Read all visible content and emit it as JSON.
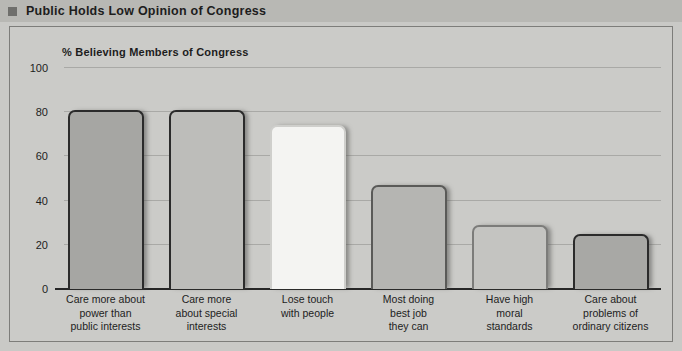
{
  "header": {
    "title": "Public Holds Low Opinion of Congress",
    "bullet_icon": "square-bullet-icon",
    "bar_color": "#b8b8b4",
    "bullet_color": "#6f6f6c"
  },
  "chart_data": {
    "type": "bar",
    "title": "Public Holds Low Opinion of Congress",
    "subtitle": "% Believing Members of Congress",
    "xlabel": "",
    "ylabel": "",
    "ylim": [
      0,
      100
    ],
    "yticks": [
      0,
      20,
      40,
      60,
      80,
      100
    ],
    "ytick_labels": [
      "0",
      "20",
      "40",
      "60",
      "80",
      "100"
    ],
    "grid": true,
    "legend": "none",
    "categories": [
      "Care more about power than public interests",
      "Care more about special interests",
      "Lose touch with people",
      "Most doing best job they can",
      "Have high moral standards",
      "Care about problems of ordinary citizens"
    ],
    "category_lines": [
      [
        "Care more about",
        "power than",
        "public interests"
      ],
      [
        "Care more",
        "about special",
        "interests"
      ],
      [
        "Lose touch",
        "with people"
      ],
      [
        "Most doing",
        "best job",
        "they can"
      ],
      [
        "Have high",
        "moral",
        "standards"
      ],
      [
        "Care about",
        "problems of",
        "ordinary citizens"
      ]
    ],
    "values": [
      81,
      81,
      74,
      47,
      29,
      25
    ],
    "bar_fills": [
      "#a6a6a3",
      "#bdbdba",
      "#f4f4f2",
      "#b5b5b2",
      "#c4c4c1",
      "#a8a8a5"
    ],
    "bar_borders": [
      "#2b2b2b",
      "#2b2b2b",
      "#cfcfcc",
      "#5a5a58",
      "#7c7c7a",
      "#2b2b2b"
    ],
    "background_color": "#cbcbc8",
    "gridline_color": "#a9a9a6",
    "axis_color": "#262626"
  }
}
